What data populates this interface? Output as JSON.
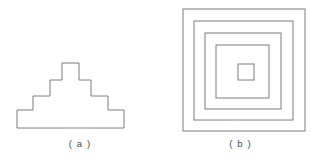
{
  "figure": {
    "background_color": "#ffffff",
    "stroke_color": "#7d7d7d",
    "stroke_width": 1,
    "fill_color": "none",
    "panels": [
      {
        "id": "a",
        "label": "( a )",
        "shape_name": "stepped-pyramid-outline",
        "description": "Symmetric stepped pyramid (ziggurat) outline with four steps ascending on each side and a flat apex",
        "steps_per_side": 4,
        "bounds": {
          "x": 17,
          "y": 63,
          "width": 124,
          "height": 65
        }
      },
      {
        "id": "b",
        "label": "( b )",
        "shape_name": "concentric-squares",
        "description": "Five nested concentric squares sharing a common center",
        "square_count": 5,
        "bounds": {
          "x": 183,
          "y": 9,
          "width": 122,
          "height": 121
        }
      }
    ]
  },
  "chart_data": {
    "type": "diagram",
    "title": "",
    "panel_a": {
      "name": "stepped-pyramid-outline",
      "polygon_points": "17,128 17,110 33,110 33,96 50,96 50,80 62,80 62,63 79,63 79,80 91,80 91,96 108,96 108,110 124,110 124,128",
      "step_risers_y": [
        128,
        110,
        96,
        80,
        63
      ],
      "apex": {
        "x1": 62,
        "x2": 79,
        "y": 63
      },
      "base": {
        "x1": 17,
        "x2": 141,
        "y": 128
      }
    },
    "panel_b": {
      "name": "concentric-squares",
      "squares": [
        {
          "index": 1,
          "x": 183,
          "y": 9,
          "size": 122
        },
        {
          "index": 2,
          "x": 194,
          "y": 21,
          "size": 99
        },
        {
          "index": 3,
          "x": 205,
          "y": 33,
          "size": 76
        },
        {
          "index": 4,
          "x": 216,
          "y": 45,
          "size": 53
        },
        {
          "index": 5,
          "x": 238,
          "y": 64,
          "size": 16
        }
      ]
    }
  }
}
